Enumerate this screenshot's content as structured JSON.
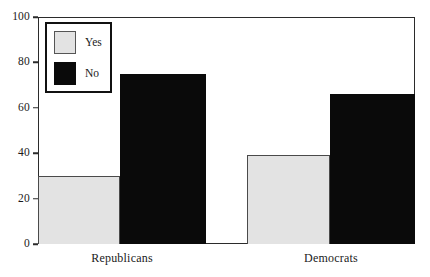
{
  "chart_data": {
    "type": "bar",
    "title": "",
    "xlabel": "",
    "ylabel": "",
    "categories": [
      "Republicans",
      "Democrats"
    ],
    "series": [
      {
        "name": "Yes",
        "values": [
          30,
          39
        ],
        "color": "#e3e3e3"
      },
      {
        "name": "No",
        "values": [
          75,
          66
        ],
        "color": "#0a0a0a"
      }
    ],
    "ylim": [
      0,
      100
    ],
    "yticks": [
      0,
      20,
      40,
      60,
      80,
      100
    ],
    "ytick_labels": [
      "0",
      "20",
      "40",
      "60",
      "80",
      "100"
    ],
    "grid": false,
    "legend_position": "upper-left",
    "bar_style": "adjacent-grouped"
  },
  "legend": {
    "entries": [
      {
        "label": "Yes",
        "swatch": "light-gray-swatch"
      },
      {
        "label": "No",
        "swatch": "black-swatch"
      }
    ]
  },
  "axes": {
    "y_ticks": [
      "0",
      "20",
      "40",
      "60",
      "80",
      "100"
    ],
    "x_labels": [
      "Republicans",
      "Democrats"
    ]
  }
}
